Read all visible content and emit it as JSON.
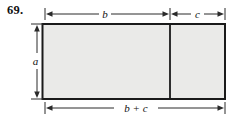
{
  "problem": {
    "number": "69."
  },
  "diagram": {
    "labels": {
      "top_left_width": "b",
      "top_right_width": "c",
      "left_height": "a",
      "bottom_total_width": "b + c"
    },
    "colors": {
      "rect_fill": "#eaeae8",
      "line": "#2a2a2a",
      "outline": "#1a1a1a"
    }
  }
}
